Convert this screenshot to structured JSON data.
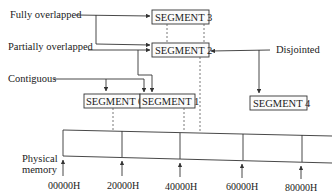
{
  "diagram": {
    "labels": {
      "fully_overlapped": "Fully overlapped",
      "partially_overlapped": "Partially overlapped",
      "contiguous": "Contiguous",
      "disjointed": "Disjointed",
      "physical_memory_line1": "Physical",
      "physical_memory_line2": "memory"
    },
    "segments": [
      {
        "id": "seg0",
        "label": "SEGMENT 0"
      },
      {
        "id": "seg1",
        "label": "SEGMENT 1"
      },
      {
        "id": "seg2",
        "label": "SEGMENT 2"
      },
      {
        "id": "seg3",
        "label": "SEGMENT 3"
      },
      {
        "id": "seg4",
        "label": "SEGMENT 4"
      }
    ],
    "addresses": [
      "00000H",
      "20000H",
      "40000H",
      "60000H",
      "80000H"
    ],
    "colors": {
      "line": "#333333",
      "text": "#1a1a1a",
      "background": "#ffffff"
    }
  }
}
